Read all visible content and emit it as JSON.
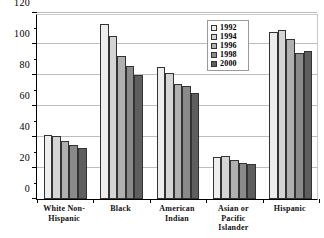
{
  "chart_data": {
    "type": "bar",
    "title": "",
    "subtitle": "",
    "xlabel": "",
    "ylabel": "",
    "ylim": [
      0,
      120
    ],
    "ytick_values": [
      0,
      20,
      40,
      60,
      80,
      100,
      120
    ],
    "ytick_labels": [
      "0",
      "20",
      "40",
      "60",
      "80",
      "100",
      "120"
    ],
    "yminor_values": [
      10,
      30,
      50,
      70,
      90,
      110
    ],
    "grid": true,
    "grid_axis": "y",
    "legend_position": "top-right-inside",
    "categories": [
      "White Non-\nHispanic",
      "Black",
      "American\nIndian",
      "Asian or\nPacific\nIslander",
      "Hispanic"
    ],
    "category_labels": [
      [
        "White Non-",
        "Hispanic"
      ],
      [
        "Black"
      ],
      [
        "American",
        "Indian"
      ],
      [
        "Asian or",
        "Pacific",
        "Islander"
      ],
      [
        "Hispanic"
      ]
    ],
    "series": [
      {
        "name": "1992",
        "color": "#ededed",
        "values": [
          41.5,
          113.0,
          85.0,
          27.0,
          108.0
        ]
      },
      {
        "name": "1994",
        "color": "#d4d4d4",
        "values": [
          40.5,
          105.0,
          81.0,
          27.5,
          109.0
        ]
      },
      {
        "name": "1996",
        "color": "#b0b0b0",
        "values": [
          37.5,
          92.0,
          74.5,
          25.0,
          103.0
        ]
      },
      {
        "name": "1998",
        "color": "#8a8a8a",
        "values": [
          35.0,
          86.0,
          73.0,
          23.5,
          94.5
        ]
      },
      {
        "name": "2000",
        "color": "#5e5e5e",
        "values": [
          33.0,
          80.0,
          68.5,
          22.5,
          95.5
        ]
      }
    ]
  },
  "legend": {
    "items": [
      {
        "label": "1992"
      },
      {
        "label": "1994"
      },
      {
        "label": "1996"
      },
      {
        "label": "1998"
      },
      {
        "label": "2000"
      }
    ]
  },
  "axis": {
    "y_max_label": "120",
    "y_min_label": "0"
  }
}
